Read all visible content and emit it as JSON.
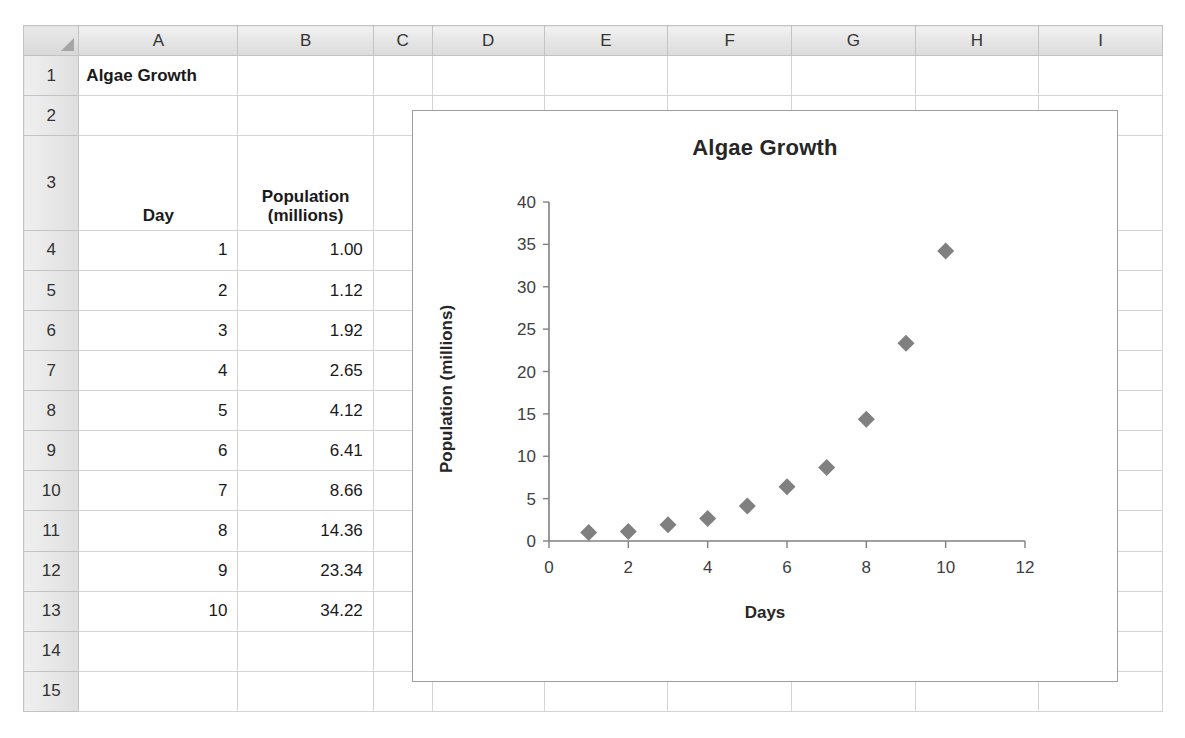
{
  "spreadsheet": {
    "column_headers": [
      "A",
      "B",
      "C",
      "D",
      "E",
      "F",
      "G",
      "H",
      "I"
    ],
    "row_headers": [
      "1",
      "2",
      "3",
      "4",
      "5",
      "6",
      "7",
      "8",
      "9",
      "10",
      "11",
      "12",
      "13",
      "14",
      "15"
    ],
    "corner_label": "",
    "cells": {
      "A1": "Algae Growth",
      "A3": "Day",
      "B3": "Population (millions)",
      "B3_line1": "Population",
      "B3_line2": "(millions)",
      "days": [
        "1",
        "2",
        "3",
        "4",
        "5",
        "6",
        "7",
        "8",
        "9",
        "10"
      ],
      "population": [
        "1.00",
        "1.12",
        "1.92",
        "2.65",
        "4.12",
        "6.41",
        "8.66",
        "14.36",
        "23.34",
        "34.22"
      ]
    }
  },
  "chart_data": {
    "type": "scatter",
    "title": "Algae Growth",
    "xlabel": "Days",
    "ylabel": "Population (millions)",
    "x": [
      1,
      2,
      3,
      4,
      5,
      6,
      7,
      8,
      9,
      10
    ],
    "values": [
      1.0,
      1.12,
      1.92,
      2.65,
      4.12,
      6.41,
      8.66,
      14.36,
      23.34,
      34.22
    ],
    "xlim": [
      0,
      12
    ],
    "ylim": [
      0,
      40
    ],
    "xticks": [
      0,
      2,
      4,
      6,
      8,
      10,
      12
    ],
    "yticks": [
      0,
      5,
      10,
      15,
      20,
      25,
      30,
      35,
      40
    ],
    "grid": false,
    "legend": false,
    "marker": "diamond",
    "marker_color": "#808080",
    "axis_color": "#808080",
    "title_color": "#262626"
  }
}
